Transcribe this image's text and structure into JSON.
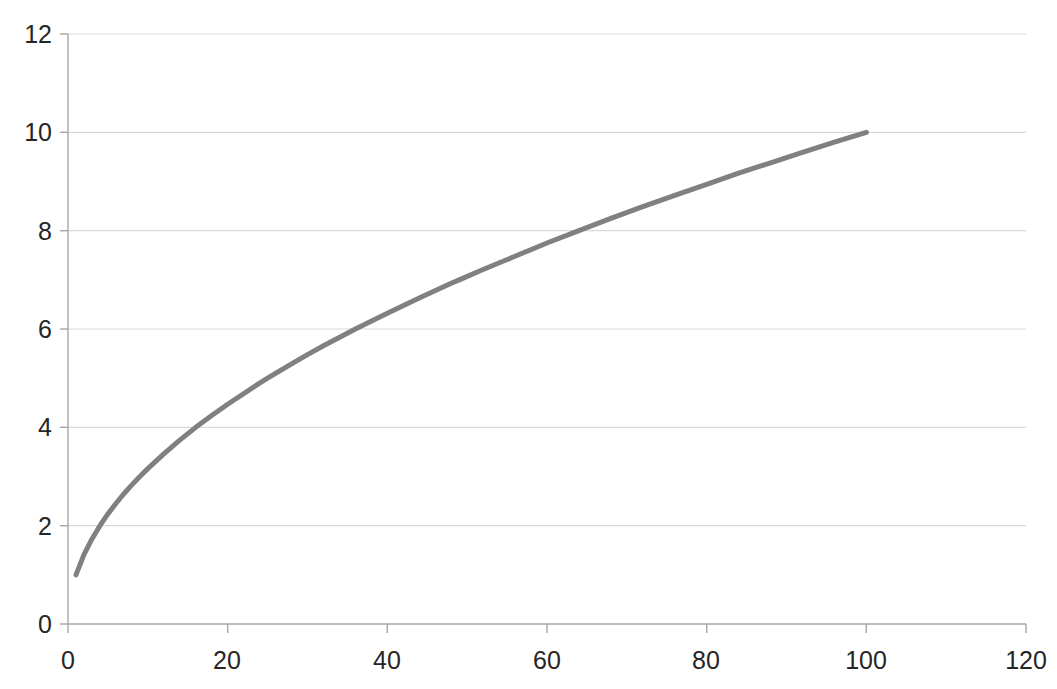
{
  "chart_data": {
    "type": "line",
    "title": "",
    "xlabel": "",
    "ylabel": "",
    "xlim": [
      0,
      120
    ],
    "ylim": [
      0,
      12
    ],
    "xticks": [
      0,
      20,
      40,
      60,
      80,
      100,
      120
    ],
    "yticks": [
      0,
      2,
      4,
      6,
      8,
      10,
      12
    ],
    "grid": "horizontal",
    "legend": "none",
    "series": [
      {
        "name": "sqrt(x)",
        "color": "#808080",
        "line_width": 5,
        "smooth": true,
        "x": [
          1,
          2,
          3,
          4,
          5,
          6,
          7,
          8,
          9,
          10,
          12,
          14,
          16,
          18,
          20,
          24,
          25,
          28,
          30,
          32,
          36,
          40,
          44,
          48,
          49,
          52,
          56,
          60,
          64,
          68,
          72,
          76,
          80,
          84,
          88,
          92,
          96,
          100
        ],
        "values": [
          1,
          1.41,
          1.73,
          2,
          2.24,
          2.45,
          2.65,
          2.83,
          3,
          3.16,
          3.46,
          3.74,
          4,
          4.24,
          4.47,
          4.9,
          5,
          5.29,
          5.48,
          5.66,
          6,
          6.32,
          6.63,
          6.93,
          7,
          7.21,
          7.48,
          7.75,
          8,
          8.25,
          8.49,
          8.72,
          8.94,
          9.17,
          9.38,
          9.59,
          9.8,
          10
        ]
      }
    ]
  },
  "axes": {
    "y_tick_labels": [
      "12",
      "10",
      "8",
      "6",
      "4",
      "2",
      "0"
    ],
    "x_tick_labels": [
      "0",
      "20",
      "40",
      "60",
      "80",
      "100",
      "120"
    ]
  },
  "colors": {
    "series": "#808080",
    "gridline": "#d9d9d9",
    "axis_line": "#a6a6a6",
    "tick_label": "#262626",
    "background": "#ffffff"
  }
}
